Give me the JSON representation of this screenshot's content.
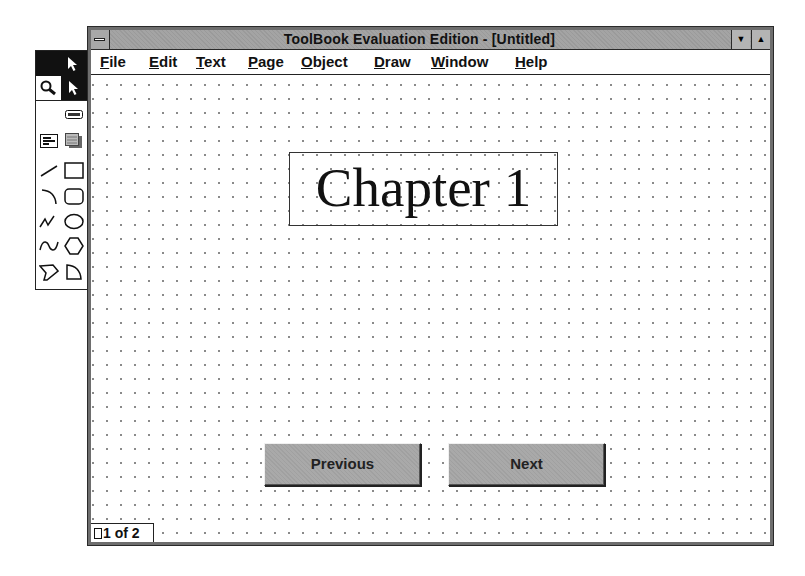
{
  "window": {
    "title": "ToolBook Evaluation Edition - [Untitled]",
    "minimize_glyph": "▼",
    "maximize_glyph": "▲"
  },
  "menubar": {
    "items": [
      {
        "label": "File",
        "accel": "F",
        "rest": "ile"
      },
      {
        "label": "Edit",
        "accel": "E",
        "rest": "dit"
      },
      {
        "label": "Text",
        "accel": "T",
        "rest": "ext"
      },
      {
        "label": "Page",
        "accel": "P",
        "rest": "age"
      },
      {
        "label": "Object",
        "accel": "O",
        "rest": "bject"
      },
      {
        "label": "Draw",
        "accel": "D",
        "rest": "raw"
      },
      {
        "label": "Window",
        "accel": "W",
        "rest": "indow"
      },
      {
        "label": "Help",
        "accel": "H",
        "rest": "elp"
      }
    ]
  },
  "page": {
    "heading": "Chapter 1",
    "buttons": {
      "previous": "Previous",
      "next": "Next"
    },
    "indicator": "1 of 2"
  },
  "palette": {
    "tools": [
      "selection-arrow",
      "zoom-magnifier",
      "reader-arrow",
      "button-tool",
      "field-tool",
      "record-field-tool",
      "line-tool",
      "rectangle-tool",
      "arc-tool",
      "rounded-rectangle-tool",
      "angled-line-tool",
      "ellipse-tool",
      "curve-tool",
      "polygon-tool",
      "irregular-polygon-tool",
      "pie-tool"
    ]
  },
  "colors": {
    "titlebar": "#a4a4a4",
    "button_face": "#a9a9a9",
    "frame": "#6e6e6e"
  }
}
